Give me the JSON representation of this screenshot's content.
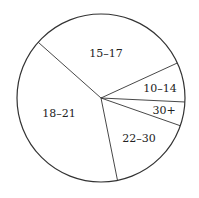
{
  "chart_data": {
    "type": "pie",
    "title": "",
    "start_angle_deg": 138.4,
    "direction": "clockwise",
    "slices": [
      {
        "label": "15–17",
        "value": 31.6,
        "label_pos": [
          106,
          54
        ]
      },
      {
        "label": "10–14",
        "value": 7.6,
        "label_pos": [
          160,
          89
        ]
      },
      {
        "label": "30+",
        "value": 4.6,
        "label_pos": [
          164,
          111
        ]
      },
      {
        "label": "22–30",
        "value": 16.5,
        "label_pos": [
          139,
          139
        ]
      },
      {
        "label": "18–21",
        "value": 39.7,
        "label_pos": [
          59,
          114
        ]
      }
    ],
    "center": [
      101,
      98
    ],
    "radius": 84,
    "fill_color": "#ffffff",
    "stroke_color": "#333333",
    "legend": "none"
  }
}
